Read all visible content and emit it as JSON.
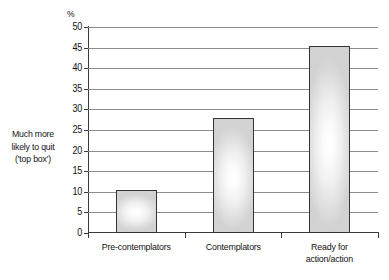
{
  "chart_data": {
    "type": "bar",
    "title": "",
    "subtitle": "",
    "xlabel": "",
    "ylabel": "%",
    "unit_label": "%",
    "categories": [
      "Pre-contemplators",
      "Contemplators",
      "Ready for action/action"
    ],
    "category_lines": [
      [
        "Pre-contemplators"
      ],
      [
        "Contemplators"
      ],
      [
        "Ready for",
        "action/action"
      ]
    ],
    "values": [
      10.5,
      27.8,
      45.3
    ],
    "ylim": [
      0,
      50
    ],
    "ytick_step": 5,
    "yticks": [
      50,
      45,
      40,
      35,
      30,
      25,
      20,
      15,
      10,
      5,
      0
    ],
    "ytick_labels": [
      "50",
      "45",
      "40",
      "35",
      "30",
      "25",
      "20",
      "15",
      "10",
      "5",
      "0"
    ],
    "grid": true,
    "grid_axis": "y",
    "legend": false,
    "legend_position": "none",
    "annotation_lines": [
      "Much more",
      "likely to quit",
      "('top box')"
    ],
    "annotation_position": "left-of-axis",
    "colors": {
      "bar_fill_center": "#ffffff",
      "bar_fill_edge": "#d2d2d2",
      "bar_border": "#333333",
      "gridline": "#8c8c8c",
      "axis": "#3a3a3a",
      "text": "#121212",
      "background": "#ffffff"
    }
  }
}
